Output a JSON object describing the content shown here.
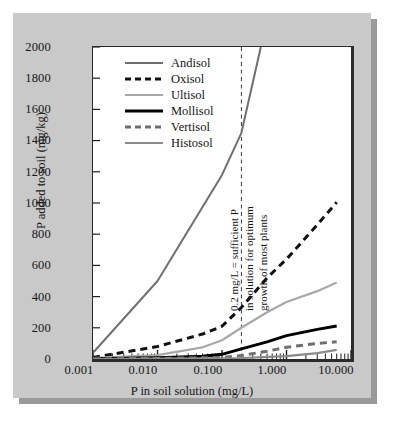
{
  "chart_data": {
    "type": "line",
    "title": "",
    "xlabel": "P in soil solution (mg/L)",
    "ylabel": "P added to soil (mg/kg)",
    "xscale": "log",
    "xlim": [
      0.001,
      10.0
    ],
    "ylim": [
      0,
      2000
    ],
    "xticks": [
      "0.001",
      "0.010",
      "0.100",
      "1.000",
      "10.000"
    ],
    "xtick_values": [
      0.001,
      0.01,
      0.1,
      1.0,
      10.0
    ],
    "yticks": [
      "0",
      "200",
      "400",
      "600",
      "800",
      "1000",
      "1200",
      "1400",
      "1600",
      "1800",
      "2000"
    ],
    "ytick_values": [
      0,
      200,
      400,
      600,
      800,
      1000,
      1200,
      1400,
      1600,
      1800,
      2000
    ],
    "grid": false,
    "legend_position": "upper-left",
    "series": [
      {
        "name": "Andisol",
        "color": "#6f6f6f",
        "style": "solid",
        "width": 2.0,
        "x": [
          0.001,
          0.01,
          0.1,
          0.2,
          0.4
        ],
        "y": [
          40,
          500,
          1180,
          1450,
          2000
        ]
      },
      {
        "name": "Oxisol",
        "color": "#111111",
        "style": "dashed",
        "width": 3.0,
        "x": [
          0.001,
          0.01,
          0.05,
          0.1,
          0.2,
          0.5,
          1.0,
          3.0,
          6.0
        ],
        "y": [
          10,
          80,
          160,
          210,
          330,
          520,
          640,
          860,
          1005
        ]
      },
      {
        "name": "Ultisol",
        "color": "#a8a8a8",
        "style": "solid",
        "width": 2.2,
        "x": [
          0.001,
          0.01,
          0.05,
          0.1,
          0.2,
          0.5,
          1.0,
          3.0,
          6.0
        ],
        "y": [
          5,
          25,
          75,
          120,
          200,
          300,
          365,
          435,
          490
        ]
      },
      {
        "name": "Mollisol",
        "color": "#000000",
        "style": "solid",
        "width": 3.0,
        "x": [
          0.001,
          0.01,
          0.05,
          0.1,
          0.2,
          0.5,
          1.0,
          3.0,
          6.0
        ],
        "y": [
          2,
          8,
          18,
          30,
          65,
          110,
          150,
          190,
          212
        ]
      },
      {
        "name": "Vertisol",
        "color": "#6f6f6f",
        "style": "dashed",
        "width": 3.0,
        "x": [
          0.001,
          0.01,
          0.1,
          0.2,
          0.5,
          1.0,
          3.0,
          6.0
        ],
        "y": [
          1,
          4,
          10,
          22,
          50,
          75,
          100,
          110
        ]
      },
      {
        "name": "Histosol",
        "color": "#8a8a8a",
        "style": "solid",
        "width": 2.2,
        "x": [
          0.001,
          0.01,
          0.1,
          0.2,
          1.0,
          3.0,
          6.0
        ],
        "y": [
          0,
          2,
          4,
          6,
          18,
          38,
          58
        ]
      }
    ],
    "annotations": [
      {
        "name": "sufficient-p-threshold",
        "x_value": 0.2,
        "style": "dashed-vertical-line",
        "color": "#3a3a3a",
        "text_lines": [
          "0.2 mg/L = sufficient P",
          "in solution for optimum",
          "growth of most plants"
        ]
      }
    ]
  },
  "axes": {
    "ylabel": "P added to soil (mg/kg)",
    "xlabel": "P in soil solution (mg/L)",
    "yticks": [
      "2000",
      "1800",
      "1600",
      "1400",
      "1200",
      "1000",
      "800",
      "600",
      "400",
      "200",
      "0"
    ],
    "xticks": [
      "0.001",
      "0.010",
      "0.100",
      "1.000",
      "10.000"
    ]
  },
  "legend": {
    "items": [
      {
        "label": "Andisol"
      },
      {
        "label": "Oxisol"
      },
      {
        "label": "Ultisol"
      },
      {
        "label": "Mollisol"
      },
      {
        "label": "Vertisol"
      },
      {
        "label": "Histosol"
      }
    ]
  },
  "annotation": {
    "line1": "0.2 mg/L = sufficient P",
    "line2": "in solution for optimum",
    "line3": "growth of most plants"
  },
  "colors": {
    "panel_background": "#c9c9c9",
    "panel_shadow": "#9a9a9a",
    "plot_background": "#ffffff",
    "axis": "#2b2b2b",
    "text": "#161616"
  }
}
